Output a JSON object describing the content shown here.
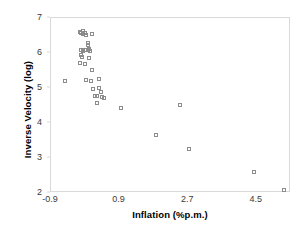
{
  "chart_data": {
    "type": "scatter",
    "title": "",
    "xlabel": "Inflation (%p.m.)",
    "ylabel": "Inverse Velocity (log)",
    "xlim": [
      -0.9,
      5.4
    ],
    "ylim": [
      2,
      7
    ],
    "xticks": [
      "-0.9",
      "0.9",
      "2.7",
      "4.5"
    ],
    "xtick_values": [
      -0.9,
      0.9,
      2.7,
      4.5
    ],
    "yticks": [
      "2",
      "3",
      "4",
      "5",
      "6",
      "7"
    ],
    "ytick_values": [
      2,
      3,
      4,
      5,
      6,
      7
    ],
    "grid": false,
    "legend": null,
    "marker": "open-square",
    "marker_color": "#8c8c8c",
    "frame_color": "#d9d9d9",
    "points": [
      {
        "x": -0.13,
        "y": 6.6
      },
      {
        "x": -0.1,
        "y": 6.58
      },
      {
        "x": -0.07,
        "y": 6.62
      },
      {
        "x": -0.05,
        "y": 6.55
      },
      {
        "x": -0.02,
        "y": 6.57
      },
      {
        "x": 0.02,
        "y": 6.52
      },
      {
        "x": 0.17,
        "y": 6.55
      },
      {
        "x": 0.08,
        "y": 6.28
      },
      {
        "x": 0.06,
        "y": 6.22
      },
      {
        "x": -0.1,
        "y": 6.1
      },
      {
        "x": -0.07,
        "y": 6.06
      },
      {
        "x": -0.02,
        "y": 6.08
      },
      {
        "x": 0.06,
        "y": 6.09
      },
      {
        "x": 0.1,
        "y": 6.12
      },
      {
        "x": 0.13,
        "y": 6.07
      },
      {
        "x": -0.12,
        "y": 5.93
      },
      {
        "x": -0.08,
        "y": 5.9
      },
      {
        "x": 0.11,
        "y": 5.87
      },
      {
        "x": -0.13,
        "y": 5.72
      },
      {
        "x": 0.0,
        "y": 5.7
      },
      {
        "x": 0.18,
        "y": 5.52
      },
      {
        "x": -0.52,
        "y": 5.2
      },
      {
        "x": 0.02,
        "y": 5.22
      },
      {
        "x": 0.14,
        "y": 5.2
      },
      {
        "x": 0.36,
        "y": 5.25
      },
      {
        "x": 0.2,
        "y": 4.96
      },
      {
        "x": 0.36,
        "y": 5.0
      },
      {
        "x": 0.42,
        "y": 4.9
      },
      {
        "x": 0.26,
        "y": 4.78
      },
      {
        "x": 0.3,
        "y": 4.76
      },
      {
        "x": 0.44,
        "y": 4.74
      },
      {
        "x": 0.49,
        "y": 4.72
      },
      {
        "x": 0.32,
        "y": 4.58
      },
      {
        "x": 0.95,
        "y": 4.42
      },
      {
        "x": 2.48,
        "y": 4.52
      },
      {
        "x": 1.85,
        "y": 3.66
      },
      {
        "x": 2.72,
        "y": 3.26
      },
      {
        "x": 4.44,
        "y": 2.6
      },
      {
        "x": 5.22,
        "y": 2.08
      }
    ]
  }
}
